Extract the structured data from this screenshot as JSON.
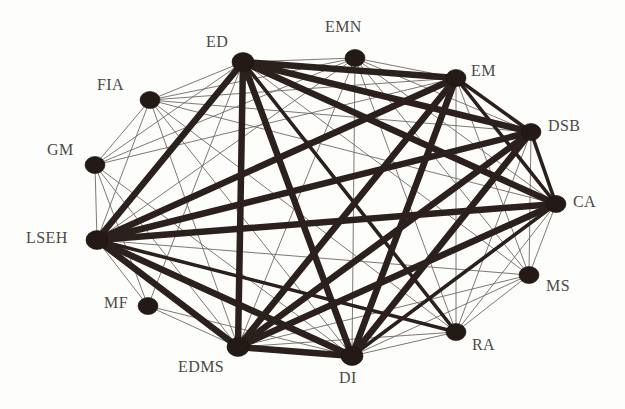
{
  "figure": {
    "type": "network-graph",
    "background_color": "#fdfdfb",
    "node_color": "#231a16",
    "edge_color_strong": "#2b201b",
    "edge_color_weak": "#6e6a66",
    "width": 625,
    "height": 409
  },
  "chart_data": {
    "type": "network",
    "title": "",
    "layout": "circular",
    "nodes": [
      {
        "id": "ED",
        "label": "ED",
        "x": 243,
        "y": 62,
        "r": 11,
        "label_x": 206,
        "label_y": 33
      },
      {
        "id": "EMN",
        "label": "EMN",
        "x": 355,
        "y": 58,
        "r": 10,
        "label_x": 325,
        "label_y": 18
      },
      {
        "id": "EM",
        "label": "EM",
        "x": 456,
        "y": 78,
        "r": 10,
        "label_x": 471,
        "label_y": 62
      },
      {
        "id": "DSB",
        "label": "DSB",
        "x": 531,
        "y": 132,
        "r": 10,
        "label_x": 548,
        "label_y": 117
      },
      {
        "id": "CA",
        "label": "CA",
        "x": 556,
        "y": 204,
        "r": 10,
        "label_x": 573,
        "label_y": 193
      },
      {
        "id": "MS",
        "label": "MS",
        "x": 529,
        "y": 275,
        "r": 10,
        "label_x": 546,
        "label_y": 277
      },
      {
        "id": "RA",
        "label": "RA",
        "x": 456,
        "y": 332,
        "r": 10,
        "label_x": 472,
        "label_y": 336
      },
      {
        "id": "DI",
        "label": "DI",
        "x": 352,
        "y": 356,
        "r": 11,
        "label_x": 339,
        "label_y": 369
      },
      {
        "id": "EDMS",
        "label": "EDMS",
        "x": 238,
        "y": 347,
        "r": 11,
        "label_x": 178,
        "label_y": 358
      },
      {
        "id": "MF",
        "label": "MF",
        "x": 148,
        "y": 306,
        "r": 10,
        "label_x": 104,
        "label_y": 294
      },
      {
        "id": "LSEH",
        "label": "LSEH",
        "x": 97,
        "y": 240,
        "r": 11,
        "label_x": 26,
        "label_y": 229
      },
      {
        "id": "GM",
        "label": "GM",
        "x": 95,
        "y": 165,
        "r": 10,
        "label_x": 47,
        "label_y": 141
      },
      {
        "id": "FIA",
        "label": "FIA",
        "x": 150,
        "y": 100,
        "r": 10,
        "label_x": 97,
        "label_y": 76
      }
    ],
    "edge_weight_levels": {
      "thick": 6.5,
      "medium": 3.6,
      "thin": 0.9
    },
    "edges": [
      {
        "source": "ED",
        "target": "EM",
        "weight": "thick"
      },
      {
        "source": "ED",
        "target": "DSB",
        "weight": "thick"
      },
      {
        "source": "ED",
        "target": "CA",
        "weight": "thick"
      },
      {
        "source": "ED",
        "target": "DI",
        "weight": "thick"
      },
      {
        "source": "ED",
        "target": "EDMS",
        "weight": "thick"
      },
      {
        "source": "ED",
        "target": "LSEH",
        "weight": "thick"
      },
      {
        "source": "ED",
        "target": "RA",
        "weight": "medium"
      },
      {
        "source": "ED",
        "target": "FIA",
        "weight": "thin"
      },
      {
        "source": "ED",
        "target": "GM",
        "weight": "thin"
      },
      {
        "source": "ED",
        "target": "MF",
        "weight": "thin"
      },
      {
        "source": "ED",
        "target": "EMN",
        "weight": "thin"
      },
      {
        "source": "ED",
        "target": "MS",
        "weight": "thin"
      },
      {
        "source": "EM",
        "target": "EDMS",
        "weight": "thick"
      },
      {
        "source": "EM",
        "target": "LSEH",
        "weight": "thick"
      },
      {
        "source": "EM",
        "target": "DI",
        "weight": "thick"
      },
      {
        "source": "EM",
        "target": "DSB",
        "weight": "medium"
      },
      {
        "source": "EM",
        "target": "CA",
        "weight": "medium"
      },
      {
        "source": "EM",
        "target": "FIA",
        "weight": "thin"
      },
      {
        "source": "EM",
        "target": "RA",
        "weight": "thin"
      },
      {
        "source": "EM",
        "target": "EMN",
        "weight": "thin"
      },
      {
        "source": "EM",
        "target": "MS",
        "weight": "thin"
      },
      {
        "source": "EM",
        "target": "GM",
        "weight": "thin"
      },
      {
        "source": "DSB",
        "target": "LSEH",
        "weight": "thick"
      },
      {
        "source": "DSB",
        "target": "EDMS",
        "weight": "thick"
      },
      {
        "source": "DSB",
        "target": "DI",
        "weight": "thick"
      },
      {
        "source": "DSB",
        "target": "CA",
        "weight": "medium"
      },
      {
        "source": "DSB",
        "target": "RA",
        "weight": "thin"
      },
      {
        "source": "DSB",
        "target": "MS",
        "weight": "thin"
      },
      {
        "source": "DSB",
        "target": "EMN",
        "weight": "thin"
      },
      {
        "source": "DSB",
        "target": "FIA",
        "weight": "thin"
      },
      {
        "source": "CA",
        "target": "LSEH",
        "weight": "thick"
      },
      {
        "source": "CA",
        "target": "EDMS",
        "weight": "thick"
      },
      {
        "source": "CA",
        "target": "DI",
        "weight": "medium"
      },
      {
        "source": "CA",
        "target": "MS",
        "weight": "thin"
      },
      {
        "source": "CA",
        "target": "RA",
        "weight": "thin"
      },
      {
        "source": "CA",
        "target": "FIA",
        "weight": "thin"
      },
      {
        "source": "CA",
        "target": "EMN",
        "weight": "thin"
      },
      {
        "source": "LSEH",
        "target": "EDMS",
        "weight": "thick"
      },
      {
        "source": "LSEH",
        "target": "DI",
        "weight": "thick"
      },
      {
        "source": "LSEH",
        "target": "RA",
        "weight": "medium"
      },
      {
        "source": "LSEH",
        "target": "FIA",
        "weight": "thin"
      },
      {
        "source": "LSEH",
        "target": "GM",
        "weight": "thin"
      },
      {
        "source": "LSEH",
        "target": "MF",
        "weight": "thin"
      },
      {
        "source": "LSEH",
        "target": "EMN",
        "weight": "thin"
      },
      {
        "source": "LSEH",
        "target": "MS",
        "weight": "thin"
      },
      {
        "source": "EDMS",
        "target": "DI",
        "weight": "thick"
      },
      {
        "source": "EDMS",
        "target": "RA",
        "weight": "thin"
      },
      {
        "source": "EDMS",
        "target": "MF",
        "weight": "thin"
      },
      {
        "source": "EDMS",
        "target": "GM",
        "weight": "thin"
      },
      {
        "source": "EDMS",
        "target": "FIA",
        "weight": "thin"
      },
      {
        "source": "EDMS",
        "target": "EMN",
        "weight": "thin"
      },
      {
        "source": "EDMS",
        "target": "MS",
        "weight": "thin"
      },
      {
        "source": "DI",
        "target": "RA",
        "weight": "thin"
      },
      {
        "source": "DI",
        "target": "EMN",
        "weight": "thin"
      },
      {
        "source": "DI",
        "target": "FIA",
        "weight": "thin"
      },
      {
        "source": "DI",
        "target": "GM",
        "weight": "thin"
      },
      {
        "source": "DI",
        "target": "MS",
        "weight": "thin"
      },
      {
        "source": "DI",
        "target": "MF",
        "weight": "thin"
      },
      {
        "source": "FIA",
        "target": "GM",
        "weight": "thin"
      },
      {
        "source": "FIA",
        "target": "EMN",
        "weight": "thin"
      },
      {
        "source": "FIA",
        "target": "RA",
        "weight": "thin"
      },
      {
        "source": "GM",
        "target": "MF",
        "weight": "thin"
      },
      {
        "source": "GM",
        "target": "EMN",
        "weight": "thin"
      },
      {
        "source": "EMN",
        "target": "RA",
        "weight": "thin"
      },
      {
        "source": "EMN",
        "target": "MS",
        "weight": "thin"
      },
      {
        "source": "RA",
        "target": "MS",
        "weight": "thin"
      }
    ]
  }
}
